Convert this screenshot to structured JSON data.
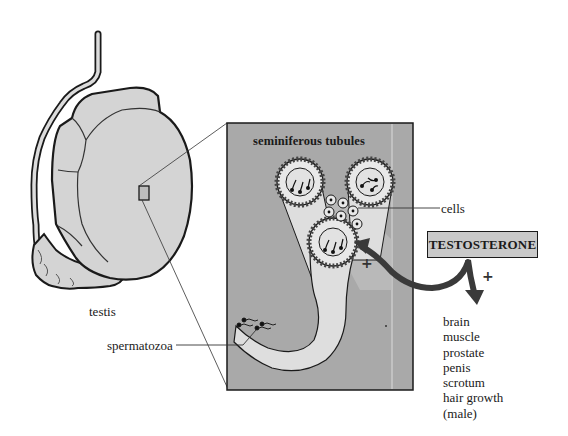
{
  "labels": {
    "testis": "testis",
    "panel_title": "seminiferous tubules",
    "cells": "cells",
    "spermatozoa": "spermatozoa",
    "hormone": "TESTOSTERONE",
    "plus_panel": "+",
    "plus_hormone": "+"
  },
  "targets": [
    "brain",
    "muscle",
    "prostate",
    "penis",
    "scrotum",
    "hair growth",
    "(male)"
  ],
  "colors": {
    "organ_fill": "#d4d4d4",
    "panel_fill": "#a9a9a9",
    "tubule_fill": "#dedede",
    "outline": "#1a1a1a",
    "arrow": "#3a3a3a",
    "hormone_box_fill": "#c9c9c9"
  }
}
